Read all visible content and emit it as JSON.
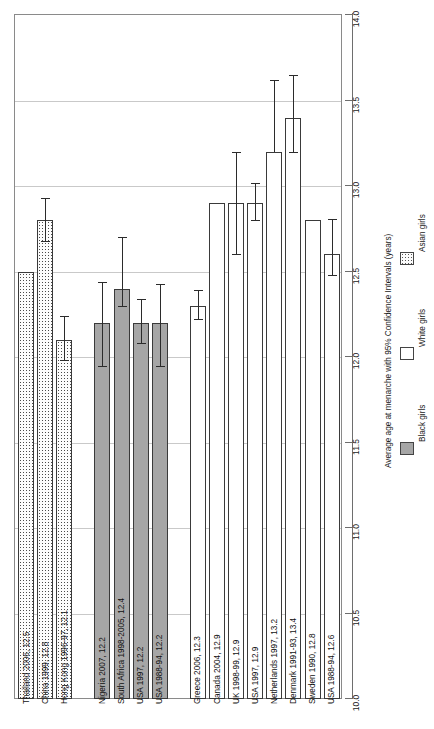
{
  "chart_data": {
    "type": "bar",
    "orientation": "vertical-bars-rotated-labels",
    "title": "",
    "xlabel": "",
    "ylabel": "Average age at menarche with 95% Confidence Intervals (years)",
    "ylim": [
      10.0,
      14.0
    ],
    "yticks": [
      "10.0",
      "10.5",
      "11.0",
      "11.5",
      "12.0",
      "12.5",
      "13.0",
      "13.5",
      "14.0"
    ],
    "ytick_values": [
      10.0,
      10.5,
      11.0,
      11.5,
      12.0,
      12.5,
      13.0,
      13.5,
      14.0
    ],
    "grid": true,
    "gridlines_at": [
      10.5,
      11.0,
      11.5,
      12.0,
      12.5,
      13.0,
      13.5
    ],
    "legend_position": "right",
    "legend": [
      {
        "name": "Black girls",
        "fill": "#a6a6a6",
        "swatch": "solid-gray"
      },
      {
        "name": "White girls",
        "fill": "#ffffff",
        "swatch": "solid-white"
      },
      {
        "name": "Asian girls",
        "fill": "#fcfcfc",
        "swatch": "dotted"
      }
    ],
    "categories": [
      "Thailand 2006, 12.5",
      "China 1999, 12.8",
      "Hong Kong 1996-97, 12.1",
      "Nigeria 2007, 12.2",
      "South Africa 1998-2005, 12.4",
      "USA 1997, 12.2",
      "USA 1988-94, 12.2",
      "Greece 2006, 12.3",
      "Canada 2004, 12.9",
      "UK 1998-99, 12.9",
      "USA 1997, 12.9",
      "Netherlands 1997, 13.2",
      "Denmark 1991-93, 13.4",
      "Sweden 1990, 12.8",
      "USA 1988-94, 12.6"
    ],
    "bars": [
      {
        "label": "Thailand 2006, 12.5",
        "group": "Asian girls",
        "value": 12.5,
        "ci_low": null,
        "ci_high": null,
        "slot": 0
      },
      {
        "label": "China 1999, 12.8",
        "group": "Asian girls",
        "value": 12.8,
        "ci_low": 12.68,
        "ci_high": 12.93,
        "slot": 1
      },
      {
        "label": "Hong Kong 1996-97, 12.1",
        "group": "Asian girls",
        "value": 12.1,
        "ci_low": 11.98,
        "ci_high": 12.24,
        "slot": 2
      },
      {
        "label": "Nigeria 2007, 12.2",
        "group": "Black girls",
        "value": 12.2,
        "ci_low": 11.95,
        "ci_high": 12.44,
        "slot": 4
      },
      {
        "label": "South Africa 1998-2005, 12.4",
        "group": "Black girls",
        "value": 12.4,
        "ci_low": 12.3,
        "ci_high": 12.7,
        "slot": 5
      },
      {
        "label": "USA 1997, 12.2",
        "group": "Black girls",
        "value": 12.2,
        "ci_low": 12.08,
        "ci_high": 12.34,
        "slot": 6
      },
      {
        "label": "USA 1988-94, 12.2",
        "group": "Black girls",
        "value": 12.2,
        "ci_low": 11.95,
        "ci_high": 12.43,
        "slot": 7
      },
      {
        "label": "Greece 2006, 12.3",
        "group": "White girls",
        "value": 12.3,
        "ci_low": 12.22,
        "ci_high": 12.39,
        "slot": 9
      },
      {
        "label": "Canada 2004, 12.9",
        "group": "White girls",
        "value": 12.9,
        "ci_low": null,
        "ci_high": null,
        "slot": 10
      },
      {
        "label": "UK 1998-99, 12.9",
        "group": "White girls",
        "value": 12.9,
        "ci_low": 12.6,
        "ci_high": 13.2,
        "slot": 11
      },
      {
        "label": "USA 1997, 12.9",
        "group": "White girls",
        "value": 12.9,
        "ci_low": 12.8,
        "ci_high": 13.02,
        "slot": 12
      },
      {
        "label": "Netherlands 1997, 13.2",
        "group": "White girls",
        "value": 13.2,
        "ci_low": null,
        "ci_high": 13.62,
        "slot": 13
      },
      {
        "label": "Denmark 1991-93, 13.4",
        "group": "White girls",
        "value": 13.4,
        "ci_low": 13.2,
        "ci_high": 13.65,
        "slot": 14
      },
      {
        "label": "Sweden 1990, 12.8",
        "group": "White girls",
        "value": 12.8,
        "ci_low": null,
        "ci_high": null,
        "slot": 15
      },
      {
        "label": "USA 1988-94, 12.6",
        "group": "White girls",
        "value": 12.6,
        "ci_low": 12.48,
        "ci_high": 12.81,
        "slot": 16
      }
    ]
  }
}
